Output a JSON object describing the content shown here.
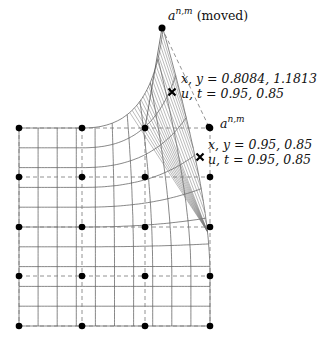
{
  "diagram": {
    "labels": {
      "moved_point": {
        "symbol": "a",
        "superscript": "n,m",
        "suffix": "(moved)"
      },
      "original_point": {
        "symbol": "a",
        "superscript": "n,m"
      },
      "moved_marker_xy": "x, y = 0.8084, 1.1813",
      "moved_marker_ut": "u, t = 0.95, 0.85",
      "orig_marker_xy": "x, y = 0.95, 0.85",
      "orig_marker_ut": "u, t = 0.95, 0.85"
    },
    "control_points": {
      "columns_x": [
        19,
        82,
        145,
        210
      ],
      "rows_y": [
        128,
        177,
        227,
        276,
        326
      ],
      "moved_point": [
        162,
        28
      ],
      "original_point": [
        209,
        127
      ]
    },
    "markers": {
      "moved_x": [
        172,
        92
      ],
      "original_x": [
        200,
        157
      ]
    },
    "grid": {
      "u_lines": 11,
      "v_lines": 11
    },
    "colors": {
      "line": "#555555",
      "dash": "#777777",
      "point": "#000000",
      "hatch": "#777777"
    }
  }
}
